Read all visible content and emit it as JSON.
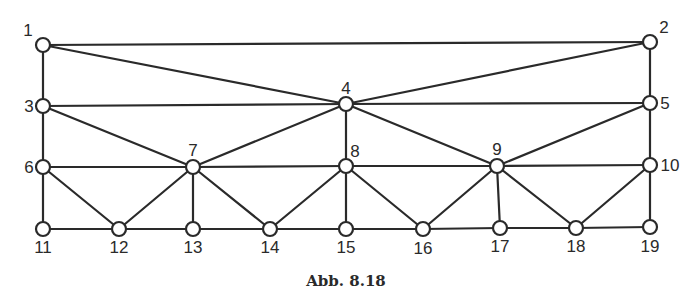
{
  "caption": "Abb. 8.18",
  "colors": {
    "stroke": "#2a2a2a",
    "background": "#ffffff"
  },
  "nodes": [
    {
      "id": "1",
      "x": 43,
      "y": 45,
      "lx": 28,
      "ly": 36,
      "anchor": "middle"
    },
    {
      "id": "2",
      "x": 650,
      "y": 42,
      "lx": 664,
      "ly": 33,
      "anchor": "middle"
    },
    {
      "id": "3",
      "x": 43,
      "y": 106,
      "lx": 29,
      "ly": 112,
      "anchor": "middle"
    },
    {
      "id": "4",
      "x": 346,
      "y": 104,
      "lx": 346,
      "ly": 94,
      "anchor": "middle"
    },
    {
      "id": "5",
      "x": 650,
      "y": 103,
      "lx": 665,
      "ly": 109,
      "anchor": "middle"
    },
    {
      "id": "6",
      "x": 43,
      "y": 167,
      "lx": 29,
      "ly": 173,
      "anchor": "middle"
    },
    {
      "id": "7",
      "x": 193,
      "y": 167,
      "lx": 193,
      "ly": 156,
      "anchor": "middle"
    },
    {
      "id": "8",
      "x": 346,
      "y": 166,
      "lx": 355,
      "ly": 157,
      "anchor": "middle"
    },
    {
      "id": "9",
      "x": 497,
      "y": 166,
      "lx": 497,
      "ly": 155,
      "anchor": "middle"
    },
    {
      "id": "10",
      "x": 650,
      "y": 165,
      "lx": 670,
      "ly": 171,
      "anchor": "middle"
    },
    {
      "id": "11",
      "x": 43,
      "y": 229,
      "lx": 43,
      "ly": 253,
      "anchor": "middle"
    },
    {
      "id": "12",
      "x": 119,
      "y": 229,
      "lx": 119,
      "ly": 253,
      "anchor": "middle"
    },
    {
      "id": "13",
      "x": 193,
      "y": 229,
      "lx": 193,
      "ly": 253,
      "anchor": "middle"
    },
    {
      "id": "14",
      "x": 270,
      "y": 229,
      "lx": 270,
      "ly": 253,
      "anchor": "middle"
    },
    {
      "id": "15",
      "x": 346,
      "y": 229,
      "lx": 346,
      "ly": 253,
      "anchor": "middle"
    },
    {
      "id": "16",
      "x": 423,
      "y": 229,
      "lx": 423,
      "ly": 254,
      "anchor": "middle"
    },
    {
      "id": "17",
      "x": 500,
      "y": 228,
      "lx": 500,
      "ly": 252,
      "anchor": "middle"
    },
    {
      "id": "18",
      "x": 576,
      "y": 228,
      "lx": 576,
      "ly": 252,
      "anchor": "middle"
    },
    {
      "id": "19",
      "x": 650,
      "y": 227,
      "lx": 650,
      "ly": 252,
      "anchor": "middle"
    }
  ],
  "edges": [
    [
      "1",
      "2"
    ],
    [
      "1",
      "4"
    ],
    [
      "1",
      "3"
    ],
    [
      "2",
      "4"
    ],
    [
      "2",
      "5"
    ],
    [
      "3",
      "4"
    ],
    [
      "4",
      "5"
    ],
    [
      "3",
      "6"
    ],
    [
      "3",
      "7"
    ],
    [
      "4",
      "7"
    ],
    [
      "4",
      "8"
    ],
    [
      "4",
      "9"
    ],
    [
      "5",
      "9"
    ],
    [
      "5",
      "10"
    ],
    [
      "6",
      "7"
    ],
    [
      "7",
      "8"
    ],
    [
      "8",
      "9"
    ],
    [
      "9",
      "10"
    ],
    [
      "6",
      "11"
    ],
    [
      "6",
      "12"
    ],
    [
      "7",
      "12"
    ],
    [
      "7",
      "13"
    ],
    [
      "7",
      "14"
    ],
    [
      "8",
      "14"
    ],
    [
      "8",
      "15"
    ],
    [
      "8",
      "16"
    ],
    [
      "9",
      "16"
    ],
    [
      "9",
      "17"
    ],
    [
      "9",
      "18"
    ],
    [
      "10",
      "18"
    ],
    [
      "10",
      "19"
    ],
    [
      "11",
      "12"
    ],
    [
      "12",
      "13"
    ],
    [
      "13",
      "14"
    ],
    [
      "14",
      "15"
    ],
    [
      "15",
      "16"
    ],
    [
      "16",
      "17"
    ],
    [
      "17",
      "18"
    ],
    [
      "18",
      "19"
    ]
  ]
}
